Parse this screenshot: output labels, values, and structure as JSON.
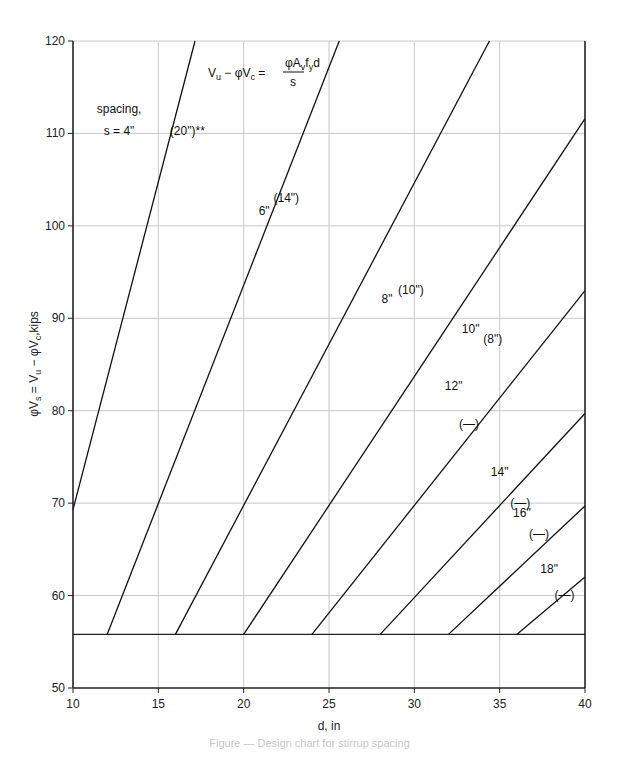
{
  "chart_data": {
    "type": "line",
    "title": "",
    "formula": {
      "lhs": "Vu − φVc =",
      "numerator": "φAvfyd",
      "denominator": "s"
    },
    "xlabel": "d, in",
    "ylabel": "φVs = Vu − φVc, kips",
    "xlim": [
      10,
      40
    ],
    "ylim": [
      50,
      120
    ],
    "xticks": [
      10,
      15,
      20,
      25,
      30,
      35,
      40
    ],
    "yticks": [
      50,
      60,
      70,
      80,
      90,
      100,
      110,
      120
    ],
    "grid": true,
    "legend": "none (lines labeled inline)",
    "floor_line": {
      "name": "minimum",
      "y": 55.8,
      "x": [
        10,
        40
      ]
    },
    "series": [
      {
        "name": "4\" (20\")**",
        "spacing": "4\"",
        "alt_spacing": "(20\")**",
        "points": [
          [
            10,
            69.3
          ],
          [
            17.15,
            120
          ]
        ]
      },
      {
        "name": "6\" (14\")",
        "spacing": "6\"",
        "alt_spacing": "(14\")",
        "points": [
          [
            12,
            55.8
          ],
          [
            25.6,
            120
          ]
        ]
      },
      {
        "name": "8\" (10\")",
        "spacing": "8\"",
        "alt_spacing": "(10\")",
        "points": [
          [
            16,
            55.8
          ],
          [
            34.4,
            120
          ]
        ]
      },
      {
        "name": "10\" (8\")",
        "spacing": "10\"",
        "alt_spacing": "(8\")",
        "points": [
          [
            20,
            55.8
          ],
          [
            40,
            111.6
          ]
        ]
      },
      {
        "name": "12\" (—)",
        "spacing": "12\"",
        "alt_spacing": "(—)",
        "points": [
          [
            24,
            55.8
          ],
          [
            40,
            93.0
          ]
        ]
      },
      {
        "name": "14\" (—)",
        "spacing": "14\"",
        "alt_spacing": "(—)",
        "points": [
          [
            28,
            55.8
          ],
          [
            40,
            79.7
          ]
        ]
      },
      {
        "name": "16\" (—)",
        "spacing": "16\"",
        "alt_spacing": "(—)",
        "points": [
          [
            32,
            55.8
          ],
          [
            40,
            69.7
          ]
        ]
      },
      {
        "name": "18\" (—)",
        "spacing": "18\"",
        "alt_spacing": "(—)",
        "points": [
          [
            36,
            55.8
          ],
          [
            40,
            62.0
          ]
        ]
      }
    ],
    "annotations": [
      {
        "text": "spacing,",
        "x": 12.7,
        "y": 112.2
      },
      {
        "text": "s = 4\"",
        "x": 12.7,
        "y": 109.8
      },
      {
        "text": "(20\")**",
        "x": 16.7,
        "y": 109.8
      },
      {
        "text": "6\"",
        "x": 21.2,
        "y": 101.2
      },
      {
        "text": "(14\")",
        "x": 22.5,
        "y": 102.6
      },
      {
        "text": "8\"",
        "x": 28.4,
        "y": 91.6
      },
      {
        "text": "(10\")",
        "x": 29.8,
        "y": 92.6
      },
      {
        "text": "10\"",
        "x": 33.3,
        "y": 88.4
      },
      {
        "text": "(8\")",
        "x": 34.6,
        "y": 87.3
      },
      {
        "text": "12\"",
        "x": 32.3,
        "y": 82.2
      },
      {
        "text": "(—)",
        "x": 33.2,
        "y": 78.1
      },
      {
        "text": "14\"",
        "x": 35.0,
        "y": 72.9
      },
      {
        "text": "(—)",
        "x": 36.2,
        "y": 69.6
      },
      {
        "text": "16\"",
        "x": 36.3,
        "y": 68.5
      },
      {
        "text": "(—)",
        "x": 37.3,
        "y": 66.2
      },
      {
        "text": "18\"",
        "x": 37.9,
        "y": 62.4
      },
      {
        "text": "(—)",
        "x": 38.8,
        "y": 59.6
      }
    ]
  },
  "caption": "Figure — Design chart for stirrup spacing"
}
